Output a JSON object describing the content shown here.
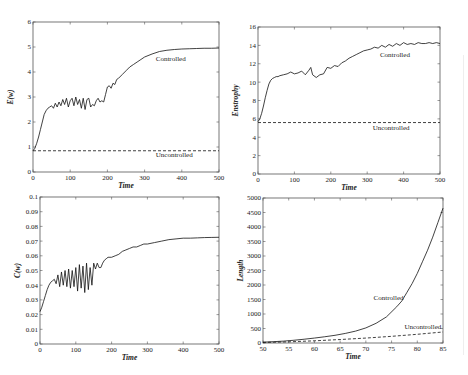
{
  "figure": {
    "panel_count": 4
  },
  "chart_data": [
    {
      "id": "energy",
      "type": "line",
      "title": "",
      "xlabel": "Time",
      "ylabel": "E(w)",
      "xlim": [
        0,
        500
      ],
      "ylim": [
        0,
        6
      ],
      "xticks": [
        0,
        100,
        200,
        300,
        400,
        500
      ],
      "yticks": [
        0,
        1,
        2,
        3,
        4,
        5,
        6
      ],
      "grid": false,
      "frame": {
        "left": 33,
        "top": 22,
        "right": 219,
        "bottom": 172
      },
      "series": [
        {
          "name": "Controlled",
          "style": "solid",
          "x": [
            0,
            5,
            10,
            15,
            20,
            25,
            30,
            35,
            40,
            45,
            50,
            55,
            60,
            65,
            70,
            75,
            80,
            85,
            90,
            95,
            100,
            105,
            110,
            115,
            120,
            125,
            130,
            135,
            140,
            145,
            150,
            155,
            160,
            165,
            170,
            175,
            180,
            185,
            190,
            195,
            200,
            205,
            210,
            215,
            220,
            225,
            230,
            240,
            250,
            260,
            270,
            280,
            290,
            300,
            320,
            340,
            360,
            380,
            400,
            420,
            440,
            460,
            480,
            500
          ],
          "values": [
            0.85,
            0.95,
            1.15,
            1.4,
            1.7,
            2.0,
            2.3,
            2.45,
            2.55,
            2.6,
            2.65,
            2.55,
            2.75,
            2.6,
            2.8,
            2.65,
            2.9,
            2.7,
            2.95,
            2.6,
            2.85,
            2.95,
            2.65,
            3.0,
            2.7,
            2.9,
            2.55,
            2.95,
            2.5,
            2.9,
            2.95,
            2.6,
            2.7,
            2.65,
            2.85,
            2.95,
            2.8,
            2.85,
            2.8,
            3.1,
            3.4,
            3.45,
            3.35,
            3.55,
            3.5,
            3.7,
            3.75,
            3.9,
            4.05,
            4.2,
            4.3,
            4.4,
            4.5,
            4.6,
            4.72,
            4.82,
            4.87,
            4.9,
            4.92,
            4.93,
            4.94,
            4.95,
            4.95,
            4.96
          ]
        },
        {
          "name": "Uncontrolled",
          "style": "dashed",
          "x": [
            0,
            500
          ],
          "values": [
            0.85,
            0.85
          ]
        }
      ],
      "annotations": [
        {
          "text": "Controlled",
          "x": 330,
          "y": 4.45
        },
        {
          "text": "Uncontrolled",
          "x": 330,
          "y": 0.6
        }
      ]
    },
    {
      "id": "enstrophy",
      "type": "line",
      "title": "",
      "xlabel": "Time",
      "ylabel": "Enstrophy",
      "xlim": [
        0,
        500
      ],
      "ylim": [
        0,
        16
      ],
      "xticks": [
        0,
        100,
        200,
        300,
        400,
        500
      ],
      "yticks": [
        0,
        2,
        4,
        6,
        8,
        10,
        12,
        14,
        16
      ],
      "grid": false,
      "frame": {
        "left": 258,
        "top": 27,
        "right": 440,
        "bottom": 174
      },
      "series": [
        {
          "name": "Controlled",
          "style": "solid",
          "x": [
            0,
            5,
            10,
            15,
            20,
            25,
            30,
            35,
            40,
            45,
            50,
            55,
            60,
            70,
            80,
            90,
            100,
            110,
            120,
            130,
            140,
            145,
            150,
            160,
            170,
            180,
            190,
            200,
            210,
            220,
            230,
            240,
            250,
            260,
            270,
            280,
            290,
            300,
            310,
            320,
            330,
            340,
            350,
            360,
            370,
            380,
            390,
            400,
            410,
            420,
            430,
            440,
            450,
            460,
            470,
            480,
            490,
            500
          ],
          "values": [
            5.7,
            6.0,
            6.6,
            7.4,
            8.3,
            9.1,
            9.8,
            10.2,
            10.4,
            10.5,
            10.6,
            10.6,
            10.7,
            10.8,
            10.9,
            11.1,
            10.9,
            11.0,
            11.2,
            10.8,
            11.3,
            11.6,
            10.8,
            10.5,
            10.8,
            10.9,
            11.6,
            11.5,
            11.8,
            11.7,
            12.1,
            12.3,
            12.6,
            12.8,
            13.0,
            13.2,
            13.4,
            13.5,
            13.6,
            13.8,
            13.7,
            14.0,
            13.8,
            14.1,
            13.9,
            14.2,
            14.0,
            14.3,
            14.1,
            14.2,
            14.1,
            14.3,
            14.2,
            14.2,
            14.3,
            14.2,
            14.3,
            14.2
          ]
        },
        {
          "name": "Uncontrolled",
          "style": "dashed",
          "x": [
            0,
            500
          ],
          "values": [
            5.6,
            5.6
          ]
        }
      ],
      "annotations": [
        {
          "text": "Controlled",
          "x": 335,
          "y": 12.7
        },
        {
          "text": "Uncontrolled",
          "x": 315,
          "y": 4.8
        }
      ]
    },
    {
      "id": "conductance",
      "type": "line",
      "title": "",
      "xlabel": "Time",
      "ylabel": "C(w)",
      "xlim": [
        0,
        500
      ],
      "ylim": [
        0,
        0.1
      ],
      "xticks": [
        0,
        100,
        200,
        300,
        400,
        500
      ],
      "yticks": [
        0,
        0.01,
        0.02,
        0.03,
        0.04,
        0.05,
        0.06,
        0.07,
        0.08,
        0.09,
        0.1
      ],
      "grid": false,
      "frame": {
        "left": 40,
        "top": 197,
        "right": 219,
        "bottom": 344
      },
      "series": [
        {
          "name": "Controlled",
          "style": "solid",
          "x": [
            0,
            5,
            10,
            15,
            20,
            25,
            30,
            35,
            40,
            45,
            50,
            55,
            60,
            65,
            70,
            75,
            80,
            85,
            90,
            95,
            100,
            105,
            110,
            115,
            120,
            125,
            130,
            135,
            140,
            145,
            150,
            155,
            160,
            165,
            170,
            175,
            180,
            185,
            190,
            200,
            210,
            220,
            230,
            240,
            250,
            260,
            270,
            280,
            290,
            300,
            320,
            340,
            360,
            380,
            400,
            420,
            440,
            460,
            480,
            500
          ],
          "values": [
            0.022,
            0.025,
            0.029,
            0.033,
            0.037,
            0.04,
            0.042,
            0.043,
            0.044,
            0.041,
            0.047,
            0.039,
            0.049,
            0.04,
            0.05,
            0.039,
            0.051,
            0.038,
            0.05,
            0.039,
            0.052,
            0.036,
            0.054,
            0.038,
            0.053,
            0.035,
            0.055,
            0.037,
            0.052,
            0.04,
            0.055,
            0.051,
            0.055,
            0.052,
            0.052,
            0.055,
            0.057,
            0.058,
            0.059,
            0.059,
            0.06,
            0.061,
            0.063,
            0.064,
            0.065,
            0.066,
            0.066,
            0.067,
            0.068,
            0.068,
            0.069,
            0.07,
            0.071,
            0.0715,
            0.072,
            0.072,
            0.0722,
            0.0724,
            0.0725,
            0.0726
          ]
        }
      ],
      "annotations": []
    },
    {
      "id": "length",
      "type": "line",
      "title": "",
      "xlabel": "Time",
      "ylabel": "Length",
      "xlim": [
        50,
        85
      ],
      "ylim": [
        0,
        5000
      ],
      "xticks": [
        50,
        55,
        60,
        65,
        70,
        75,
        80,
        85
      ],
      "yticks": [
        0,
        500,
        1000,
        1500,
        2000,
        2500,
        3000,
        3500,
        4000,
        4500,
        5000
      ],
      "grid": false,
      "frame": {
        "left": 263,
        "top": 198,
        "right": 443,
        "bottom": 343
      },
      "series": [
        {
          "name": "Controlled",
          "style": "solid",
          "x": [
            50,
            52,
            54,
            56,
            58,
            60,
            62,
            64,
            66,
            68,
            70,
            72,
            74,
            76,
            77,
            78,
            79,
            80,
            81,
            82,
            83,
            84,
            85
          ],
          "values": [
            30,
            45,
            65,
            95,
            130,
            170,
            215,
            265,
            330,
            410,
            520,
            680,
            900,
            1250,
            1450,
            1750,
            2050,
            2400,
            2800,
            3200,
            3650,
            4150,
            4650
          ]
        },
        {
          "name": "Uncontrolled",
          "style": "dashed",
          "x": [
            50,
            55,
            60,
            65,
            70,
            75,
            80,
            85
          ],
          "values": [
            20,
            40,
            75,
            120,
            170,
            230,
            300,
            380
          ]
        }
      ],
      "annotations": [
        {
          "text": "Controlled",
          "x": 71.5,
          "y": 1500
        },
        {
          "text": "Uncontrolled",
          "x": 77.5,
          "y": 500
        }
      ]
    }
  ]
}
